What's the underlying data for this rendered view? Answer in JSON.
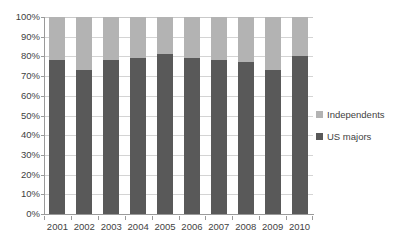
{
  "chart_data": {
    "type": "bar",
    "stacked": true,
    "stacked_100pct": true,
    "title": "",
    "subtitle": "",
    "xlabel": "",
    "ylabel": "",
    "categories": [
      "2001",
      "2002",
      "2003",
      "2004",
      "2005",
      "2006",
      "2007",
      "2008",
      "2009",
      "2010"
    ],
    "series": [
      {
        "name": "US majors",
        "color": "#595959",
        "values": [
          78,
          73,
          78,
          79,
          81,
          79,
          78,
          77,
          73,
          80
        ]
      },
      {
        "name": "Independents",
        "color": "#b3b3b3",
        "values": [
          22,
          27,
          22,
          21,
          19,
          21,
          22,
          23,
          27,
          20
        ]
      }
    ],
    "ylim": [
      0,
      100
    ],
    "ytick_values": [
      0,
      10,
      20,
      30,
      40,
      50,
      60,
      70,
      80,
      90,
      100
    ],
    "ytick_labels": [
      "0%",
      "10%",
      "20%",
      "30%",
      "40%",
      "50%",
      "60%",
      "70%",
      "80%",
      "90%",
      "100%"
    ],
    "grid": true,
    "grid_axis": "y",
    "legend_position": "right",
    "legend_entries": [
      "Independents",
      "US majors"
    ],
    "value_suffix": "%"
  },
  "colors": {
    "independents": "#b3b3b3",
    "us_majors": "#595959",
    "gridline": "#d4d4d4",
    "axis": "#9a9a9a",
    "text": "#3f3f3f",
    "background": "#ffffff"
  }
}
